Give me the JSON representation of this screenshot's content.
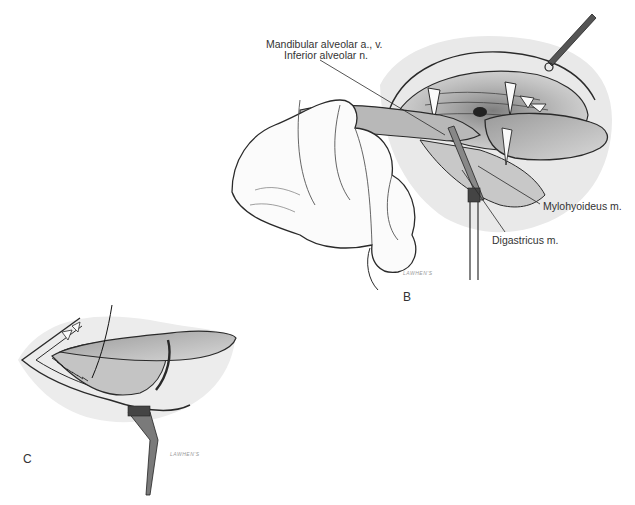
{
  "figure": {
    "panels": [
      {
        "id": "B",
        "letter": "B",
        "description": "Hand retracting tongue of open mouth exposing sublingual region with instrument",
        "labels": {
          "mandibular_alveolar": "Mandibular alveolar a., v.",
          "inferior_alveolar": "Inferior alveolar n.",
          "mylohyoideus": "Mylohyoideus m.",
          "digastricus": "Digastricus m."
        },
        "signature": "LAWHEN'S"
      },
      {
        "id": "C",
        "letter": "C",
        "description": "Suture closure of incision along mandible with retracted tongue flap",
        "signature": "LAWHEN'S"
      }
    ],
    "colors": {
      "background": "#ffffff",
      "ink": "#2a2a2a",
      "shade": "#8a8a8a",
      "label_text": "#333333"
    }
  }
}
